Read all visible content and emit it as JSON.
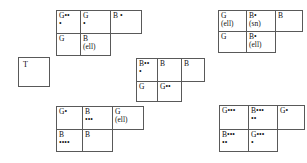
{
  "page": {
    "background": "#ffffff",
    "border_color": "#595959",
    "text_color": "#111111"
  },
  "t_box": {
    "label": "T"
  },
  "tables": [
    {
      "name": "table-top-left",
      "left": 56,
      "top": 10,
      "col_widths": [
        24,
        30,
        31
      ],
      "row_heights": [
        23,
        22
      ],
      "rows": [
        [
          {
            "line1": "G••",
            "line2": "•"
          },
          {
            "line1": "G",
            "line2": "•"
          },
          {
            "line1": "B •",
            "line2": "",
            "rowspan": 1
          }
        ],
        [
          {
            "line1": "G",
            "line2": ""
          },
          {
            "line1": "B",
            "line2": "(ell)"
          },
          {
            "blank": true
          }
        ]
      ]
    },
    {
      "name": "table-top-right",
      "left": 218,
      "top": 10,
      "col_widths": [
        28,
        29,
        27
      ],
      "row_heights": [
        21,
        21
      ],
      "rows": [
        [
          {
            "line1": "G",
            "line2": "(ell)"
          },
          {
            "line1": "B•",
            "line2": "(sn)"
          },
          {
            "line1": "B",
            "line2": ""
          }
        ],
        [
          {
            "line1": "G",
            "line2": ""
          },
          {
            "line1": "B•",
            "line2": "(ell)"
          },
          {
            "blank": true
          }
        ]
      ]
    },
    {
      "name": "table-middle",
      "left": 136,
      "top": 58,
      "col_widths": [
        21,
        24,
        23
      ],
      "row_heights": [
        23,
        20
      ],
      "rows": [
        [
          {
            "line1": "B••",
            "line2": "•"
          },
          {
            "line1": "B",
            "line2": ""
          },
          {
            "line1": "B",
            "line2": ""
          }
        ],
        [
          {
            "line1": "G",
            "line2": ""
          },
          {
            "line1": "G••",
            "line2": ""
          },
          {
            "blank": true
          }
        ]
      ]
    },
    {
      "name": "table-bottom-left",
      "left": 56,
      "top": 106,
      "col_widths": [
        26,
        30,
        31
      ],
      "row_heights": [
        23,
        22
      ],
      "rows": [
        [
          {
            "line1": "G•",
            "line2": ""
          },
          {
            "line1": "B",
            "line2": "•••"
          },
          {
            "line1": "G",
            "line2": "(ell)"
          }
        ],
        [
          {
            "line1": "B",
            "line2": "••••"
          },
          {
            "line1": "B",
            "line2": ""
          },
          {
            "blank": true
          }
        ]
      ]
    },
    {
      "name": "table-bottom-right",
      "left": 219,
      "top": 105,
      "col_widths": [
        29,
        29,
        27
      ],
      "row_heights": [
        24,
        22
      ],
      "rows": [
        [
          {
            "line1": "G•••",
            "line2": ""
          },
          {
            "line1": "B•••",
            "line2": "••"
          },
          {
            "line1": "G•",
            "line2": ""
          }
        ],
        [
          {
            "line1": "B•••",
            "line2": "••"
          },
          {
            "line1": "G•••",
            "line2": "•"
          },
          {
            "blank": true
          }
        ]
      ]
    }
  ]
}
